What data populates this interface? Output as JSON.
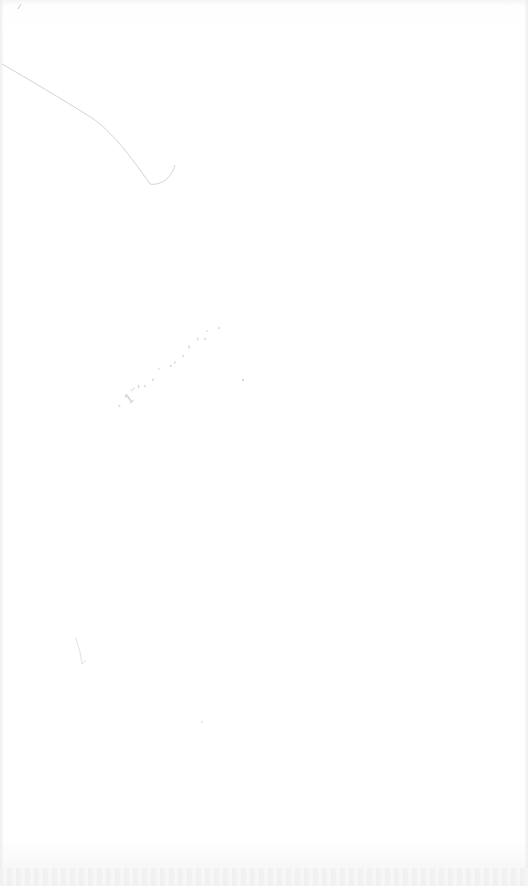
{
  "document": {
    "type": "scanned blank page",
    "annotation": {
      "text": "· 1¨’· · ˙ ·· · ‘ ´·˙ ·",
      "legible": false,
      "position": "center-left, diagonal"
    },
    "marks": {
      "pencil_stroke": "top-left diagonal line",
      "small_mark": "lower-left faint scribble",
      "corner_mark": "top-left tick"
    },
    "colors": {
      "paper": "#ffffff",
      "stroke": "#d0d0d0",
      "annotation": "#b5b5b5"
    }
  }
}
